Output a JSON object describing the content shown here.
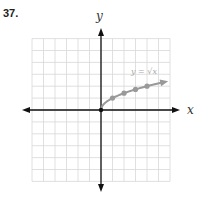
{
  "problem": {
    "number": "37."
  },
  "chart_data": {
    "type": "line",
    "title": "",
    "xlabel": "x",
    "ylabel": "y",
    "xlim": [
      -6,
      6
    ],
    "ylim": [
      -6,
      6
    ],
    "grid": true,
    "legend": null,
    "series": [
      {
        "name": "y = √x",
        "x": [
          0,
          1,
          2,
          3,
          4,
          5.5
        ],
        "y": [
          0,
          1,
          1.41,
          1.73,
          2,
          2.35
        ],
        "markers": [
          [
            0,
            0
          ],
          [
            1,
            1
          ],
          [
            2,
            1.41
          ],
          [
            3,
            1.73
          ],
          [
            4,
            2
          ]
        ],
        "color": "#999999",
        "arrow_end": true
      }
    ],
    "annotations": [
      {
        "text": "y = √x",
        "x": 3.5,
        "y": 3.3
      }
    ]
  },
  "labels": {
    "x_axis": "x",
    "y_axis": "y",
    "curve": "y = √x"
  },
  "colors": {
    "grid": "#d8d8d8",
    "axis": "#111111",
    "curve": "#999999"
  }
}
